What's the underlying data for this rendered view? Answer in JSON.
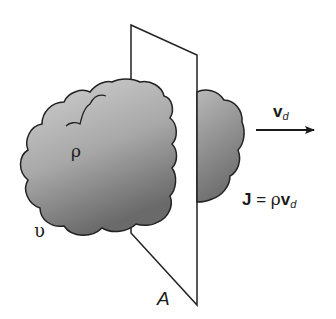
{
  "figure": {
    "labels": {
      "rho": "ρ",
      "volume": "υ",
      "surface": "A",
      "velocity_symbol": "v",
      "velocity_sub": "d",
      "current_density_symbol": "J",
      "equals": " = ",
      "current_density_rho": "ρ",
      "current_density_v": "v",
      "current_density_sub": "d"
    },
    "colors": {
      "cloud_light": "#c8c8c8",
      "cloud_dark": "#6e6e6e",
      "outline": "#222222",
      "background": "#ffffff"
    }
  }
}
